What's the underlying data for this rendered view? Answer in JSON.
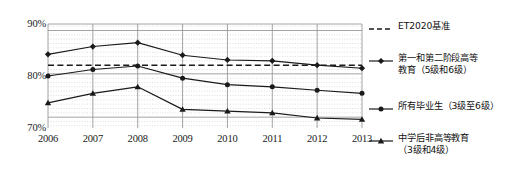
{
  "chart_data": {
    "type": "line",
    "title": "",
    "xlabel": "",
    "ylabel": "",
    "categories": [
      "2006",
      "2007",
      "2008",
      "2009",
      "2010",
      "2011",
      "2012",
      "2013"
    ],
    "ylim": [
      67.5,
      91.5
    ],
    "yticks": [
      70,
      80,
      90
    ],
    "ytick_labels": [
      "70%",
      "80%",
      "90%"
    ],
    "grid": true,
    "legend_position": "right",
    "series": [
      {
        "name": "ET2020基准",
        "marker": "none",
        "style": "dashed",
        "type": "reference-line",
        "value": 82,
        "values": [
          82,
          82,
          82,
          82,
          82,
          82,
          82,
          82
        ]
      },
      {
        "name": "第一和第二阶段高等教育（5级和6级）",
        "marker": "diamond",
        "style": "solid",
        "values": [
          84.5,
          86.3,
          87.2,
          84.3,
          83.2,
          83.0,
          82.0,
          81.3
        ]
      },
      {
        "name": "所有毕业生（3级至6级）",
        "marker": "circle",
        "style": "solid",
        "values": [
          79.5,
          81.0,
          81.8,
          79.0,
          77.5,
          77.0,
          76.2,
          75.5
        ]
      },
      {
        "name": "中学后非高等教育（3级和4级）",
        "marker": "triangle",
        "style": "solid",
        "values": [
          73.3,
          75.5,
          77.0,
          71.8,
          71.4,
          71.0,
          69.8,
          69.5
        ]
      }
    ]
  },
  "legend": {
    "items": [
      {
        "label": "ET2020基准",
        "marker": "dashed-line-marker"
      },
      {
        "label": "第一和第二阶段高等\n教育（5级和6级）",
        "marker": "diamond-marker"
      },
      {
        "label": "所有毕业生（3级至6级）",
        "marker": "circle-marker"
      },
      {
        "label": "中学后非高等教育\n（3级和4级）",
        "marker": "triangle-marker"
      }
    ]
  },
  "colors": {
    "line": "#1a1a1a",
    "grid_major": "#9a9a9a",
    "grid_minor": "#c8c8c8",
    "background": "#ffffff",
    "text": "#111111"
  }
}
